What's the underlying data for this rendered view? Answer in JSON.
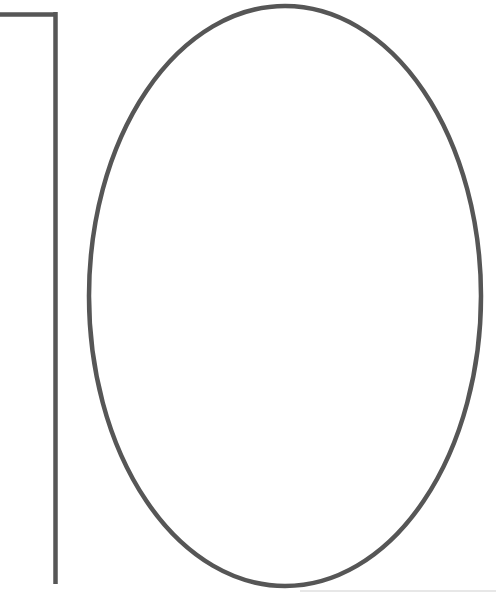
{
  "image": {
    "title": "Outline drawing of the number 10",
    "description": "A large hand-drawn style outline of the numeral 10 on a plain white background. The digit one is rendered as a horizontal top flag joined to a tall vertical stem at the left. The digit zero is rendered as a large tall ellipse outline occupying most of the frame.",
    "width": 496,
    "height": 596,
    "background_color": "#ffffff",
    "stroke_color": "#565656",
    "stroke_color_light": "#6a6a6a",
    "medium": "line-drawing",
    "subject": "numeral-10"
  },
  "glyphs": [
    {
      "name": "digit-one",
      "character": "1",
      "stroke_width": 4.5,
      "flag": {
        "x_start": 0,
        "x_end": 57,
        "y": 14.5
      },
      "stem": {
        "x": 55.5,
        "y_start": 12,
        "y_end": 584
      }
    },
    {
      "name": "digit-zero",
      "character": "0",
      "stroke_width": 4.5,
      "ellipse": {
        "center_x": 285,
        "center_y": 296,
        "radius_x": 196,
        "radius_y": 290
      }
    }
  ],
  "artifacts": [
    {
      "name": "bottom-edge-line",
      "description": "Faint light gray scan line along the lower right edge",
      "color": "#cfcfcf",
      "x_start": 300,
      "x_end": 496,
      "y": 591,
      "thickness": 1
    }
  ]
}
